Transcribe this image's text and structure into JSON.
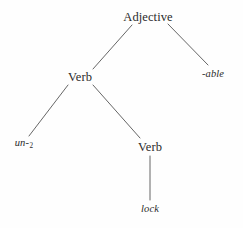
{
  "figure": {
    "type": "morphological-tree",
    "background_color": "#fefefe",
    "ink_color": "#2b2b2b",
    "edge_color": "#555555"
  },
  "nodes": {
    "root": {
      "label": "Adjective",
      "x": 148,
      "y": 17,
      "style": "category"
    },
    "verb_outer": {
      "label": "Verb",
      "x": 80,
      "y": 77,
      "style": "category"
    },
    "suffix_able": {
      "label": "-able",
      "x": 213,
      "y": 74,
      "style": "morpheme"
    },
    "prefix_un": {
      "label": "un-",
      "subscript": "2",
      "x": 24,
      "y": 144,
      "style": "morpheme"
    },
    "verb_inner": {
      "label": "Verb",
      "x": 150,
      "y": 147,
      "style": "category"
    },
    "root_lock": {
      "label": "lock",
      "x": 150,
      "y": 209,
      "style": "morpheme"
    }
  },
  "edges": [
    {
      "name": "adjective-to-verb",
      "x1": 132,
      "y1": 25,
      "x2": 93,
      "y2": 69
    },
    {
      "name": "adjective-to-able",
      "x1": 168,
      "y1": 24,
      "x2": 208,
      "y2": 65
    },
    {
      "name": "verb-to-un",
      "x1": 68,
      "y1": 85,
      "x2": 29,
      "y2": 136
    },
    {
      "name": "verb-to-verb",
      "x1": 93,
      "y1": 85,
      "x2": 140,
      "y2": 138
    },
    {
      "name": "verb-to-lock",
      "x1": 150,
      "y1": 156,
      "x2": 150,
      "y2": 200
    }
  ]
}
